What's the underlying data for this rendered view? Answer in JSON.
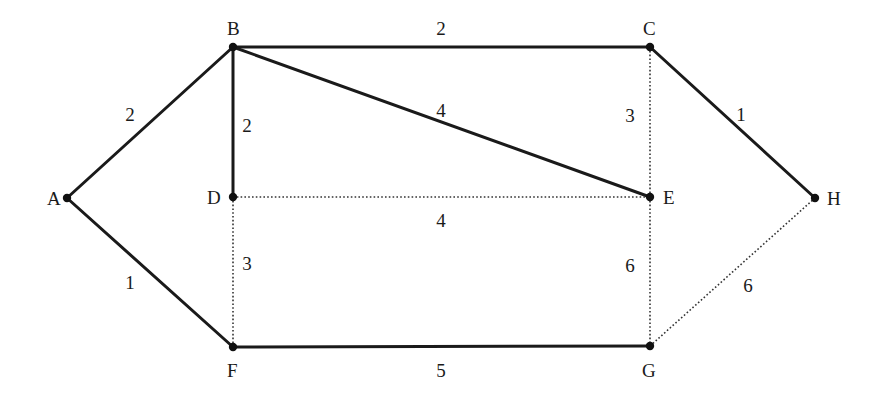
{
  "diagram": {
    "type": "weighted-graph",
    "nodes": [
      {
        "id": "A",
        "label": "A",
        "x": 67,
        "y": 198,
        "label_dx": -20,
        "label_dy": 7
      },
      {
        "id": "B",
        "label": "B",
        "x": 233,
        "y": 47,
        "label_dx": -6,
        "label_dy": -12
      },
      {
        "id": "C",
        "label": "C",
        "x": 650,
        "y": 47,
        "label_dx": -7,
        "label_dy": -12
      },
      {
        "id": "D",
        "label": "D",
        "x": 233,
        "y": 197,
        "label_dx": -26,
        "label_dy": 7
      },
      {
        "id": "E",
        "label": "E",
        "x": 650,
        "y": 197,
        "label_dx": 13,
        "label_dy": 7
      },
      {
        "id": "F",
        "label": "F",
        "x": 233,
        "y": 347,
        "label_dx": -6,
        "label_dy": 30
      },
      {
        "id": "G",
        "label": "G",
        "x": 650,
        "y": 346,
        "label_dx": -8,
        "label_dy": 31
      },
      {
        "id": "H",
        "label": "H",
        "x": 815,
        "y": 198,
        "label_dx": 12,
        "label_dy": 7
      }
    ],
    "edges": [
      {
        "from": "A",
        "to": "B",
        "weight": "2",
        "style": "solid",
        "label_x": 130,
        "label_y": 121
      },
      {
        "from": "A",
        "to": "F",
        "weight": "1",
        "style": "solid",
        "label_x": 130,
        "label_y": 289
      },
      {
        "from": "B",
        "to": "C",
        "weight": "2",
        "style": "solid",
        "label_x": 441,
        "label_y": 35
      },
      {
        "from": "B",
        "to": "D",
        "weight": "2",
        "style": "solid",
        "label_x": 247,
        "label_y": 132
      },
      {
        "from": "B",
        "to": "E",
        "weight": "4",
        "style": "solid",
        "label_x": 441,
        "label_y": 117
      },
      {
        "from": "C",
        "to": "H",
        "weight": "1",
        "style": "solid",
        "label_x": 741,
        "label_y": 121
      },
      {
        "from": "F",
        "to": "G",
        "weight": "5",
        "style": "solid",
        "label_x": 441,
        "label_y": 377
      },
      {
        "from": "C",
        "to": "E",
        "weight": "3",
        "style": "dotted",
        "label_x": 630,
        "label_y": 122
      },
      {
        "from": "D",
        "to": "E",
        "weight": "4",
        "style": "dotted",
        "label_x": 441,
        "label_y": 227
      },
      {
        "from": "D",
        "to": "F",
        "weight": "3",
        "style": "dotted",
        "label_x": 247,
        "label_y": 270
      },
      {
        "from": "E",
        "to": "G",
        "weight": "6",
        "style": "dotted",
        "label_x": 630,
        "label_y": 272
      },
      {
        "from": "G",
        "to": "H",
        "weight": "6",
        "style": "dotted",
        "label_x": 748,
        "label_y": 292
      }
    ]
  }
}
